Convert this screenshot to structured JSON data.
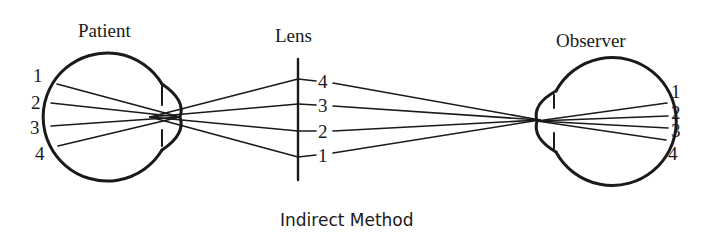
{
  "diagram": {
    "caption": "Indirect Method",
    "colors": {
      "ink": "#1a1a1a",
      "background": "#ffffff"
    },
    "patient": {
      "title": "Patient",
      "labels": [
        "1",
        "2",
        "3",
        "4"
      ]
    },
    "lens": {
      "title": "Lens",
      "labels": [
        "4",
        "3",
        "2",
        "1"
      ]
    },
    "observer": {
      "title": "Observer",
      "labels": [
        "1",
        "2",
        "3",
        "4"
      ]
    }
  }
}
